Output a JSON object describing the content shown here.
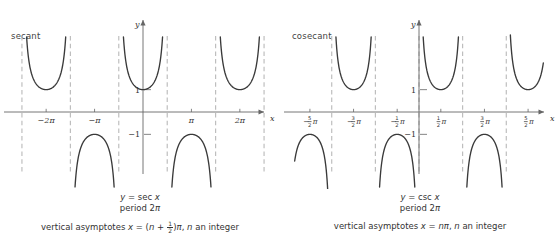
{
  "figure": {
    "background": "#ffffff",
    "curve_color": "#3a3a3a",
    "asymptote_color": "#b9b9b9",
    "axis_color": "#666666",
    "text_color": "#333333"
  },
  "panels": [
    {
      "id": "secant",
      "side_label": "secant",
      "equation_lhs": "y",
      "equation_eq": " = ",
      "equation_rhs": "sec",
      "equation_var": " x",
      "period_label": "period 2",
      "period_pi": "π",
      "asymptote_prefix": "vertical asymptotes ",
      "asymptote_x": "x",
      "asymptote_eq": " = (",
      "asymptote_n": "n",
      "asymptote_plus": " + ",
      "frac_num": "1",
      "frac_den": "2",
      "asymptote_close": ")",
      "asymptote_pi": "π",
      "asymptote_suffix": ", ",
      "asymptote_n2": "n",
      "asymptote_tail": " an integer",
      "axis_label_x": "x",
      "axis_label_y": "y",
      "y_tick_pos": "1",
      "y_tick_neg": "−1",
      "x_tick_labels": [
        "−2π",
        "−π",
        "π",
        "2π"
      ]
    },
    {
      "id": "cosecant",
      "side_label": "cosecant",
      "equation_lhs": "y",
      "equation_eq": " = ",
      "equation_rhs": "csc",
      "equation_var": " x",
      "period_label": "period 2",
      "period_pi": "π",
      "asymptote_prefix": "vertical asymptotes ",
      "asymptote_x": "x",
      "asymptote_eq": " = ",
      "asymptote_n": "n",
      "asymptote_pi": "π",
      "asymptote_suffix": ", ",
      "asymptote_n2": "n",
      "asymptote_tail": " an integer",
      "axis_label_x": "x",
      "axis_label_y": "y",
      "y_tick_pos": "1",
      "y_tick_neg": "−1",
      "x_tick_labels": [
        "5/2π neg",
        "3/2π neg",
        "1/2π neg",
        "1/2π",
        "3/2π",
        "5/2π"
      ]
    }
  ],
  "chart_data": [
    {
      "type": "line",
      "id": "secant-graph",
      "title": "y = sec x",
      "function": "sec",
      "xlabel": "x",
      "ylabel": "y",
      "xlim": [
        -7.85,
        7.85
      ],
      "ylim": [
        -3.4,
        3.4
      ],
      "period": 6.2832,
      "period_label": "2π",
      "grid": false,
      "asymptote_rule": "x = (n + 1/2)π, n an integer",
      "asymptotes": [
        -7.854,
        -4.712,
        -1.571,
        1.571,
        4.712,
        7.854
      ],
      "x_ticks": [
        -6.2832,
        -3.1416,
        3.1416,
        6.2832
      ],
      "x_tick_labels": [
        "−2π",
        "−π",
        "π",
        "2π"
      ],
      "y_ticks": [
        1,
        -1
      ],
      "y_tick_labels": [
        "1",
        "−1"
      ],
      "branches": [
        {
          "interval": [
            -7.854,
            -4.712
          ],
          "extremum": {
            "x": -6.2832,
            "y": 1
          },
          "orientation": "up"
        },
        {
          "interval": [
            -4.712,
            -1.571
          ],
          "extremum": {
            "x": -3.1416,
            "y": -1
          },
          "orientation": "down"
        },
        {
          "interval": [
            -1.571,
            1.571
          ],
          "extremum": {
            "x": 0,
            "y": 1
          },
          "orientation": "up"
        },
        {
          "interval": [
            1.571,
            4.712
          ],
          "extremum": {
            "x": 3.1416,
            "y": -1
          },
          "orientation": "down"
        },
        {
          "interval": [
            4.712,
            7.854
          ],
          "extremum": {
            "x": 6.2832,
            "y": 1
          },
          "orientation": "up"
        }
      ]
    },
    {
      "type": "line",
      "id": "cosecant-graph",
      "title": "y = csc x",
      "function": "csc",
      "xlabel": "x",
      "ylabel": "y",
      "xlim": [
        -9.0,
        9.0
      ],
      "ylim": [
        -3.4,
        3.4
      ],
      "period": 6.2832,
      "period_label": "2π",
      "grid": false,
      "asymptote_rule": "x = nπ, n an integer",
      "asymptotes": [
        -6.2832,
        -3.1416,
        0,
        3.1416,
        6.2832
      ],
      "x_ticks": [
        -7.854,
        -4.712,
        -1.571,
        1.571,
        4.712,
        7.854
      ],
      "x_tick_labels": [
        "−5/2π",
        "−3/2π",
        "−1/2π",
        "1/2π",
        "3/2π",
        "5/2π"
      ],
      "y_ticks": [
        1,
        -1
      ],
      "y_tick_labels": [
        "1",
        "−1"
      ],
      "branches": [
        {
          "interval": [
            -9.0,
            -6.2832
          ],
          "extremum": {
            "x": -7.854,
            "y": -1
          },
          "orientation": "down",
          "partial": true
        },
        {
          "interval": [
            -6.2832,
            -3.1416
          ],
          "extremum": {
            "x": -4.712,
            "y": 1
          },
          "orientation": "up"
        },
        {
          "interval": [
            -3.1416,
            0
          ],
          "extremum": {
            "x": -1.571,
            "y": -1
          },
          "orientation": "down"
        },
        {
          "interval": [
            0,
            3.1416
          ],
          "extremum": {
            "x": 1.571,
            "y": 1
          },
          "orientation": "up"
        },
        {
          "interval": [
            3.1416,
            6.2832
          ],
          "extremum": {
            "x": 4.712,
            "y": -1
          },
          "orientation": "down"
        },
        {
          "interval": [
            6.2832,
            9.0
          ],
          "extremum": {
            "x": 7.854,
            "y": 1
          },
          "orientation": "up",
          "partial": true
        }
      ]
    }
  ]
}
